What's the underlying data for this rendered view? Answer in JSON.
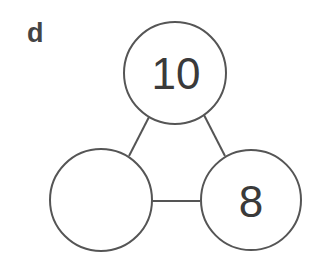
{
  "label": "d",
  "colors": {
    "stroke": "#555555",
    "text": "#3a3a3a",
    "background": "#ffffff"
  },
  "nodes": [
    {
      "id": "top",
      "value": "10",
      "cx": 175,
      "cy": 73,
      "r": 51
    },
    {
      "id": "bottom-left",
      "value": "",
      "cx": 101,
      "cy": 200,
      "r": 51
    },
    {
      "id": "bottom-right",
      "value": "8",
      "cx": 251,
      "cy": 200,
      "r": 50
    }
  ],
  "edges": [
    {
      "from": "top",
      "to": "bottom-left"
    },
    {
      "from": "top",
      "to": "bottom-right"
    },
    {
      "from": "bottom-left",
      "to": "bottom-right"
    }
  ]
}
